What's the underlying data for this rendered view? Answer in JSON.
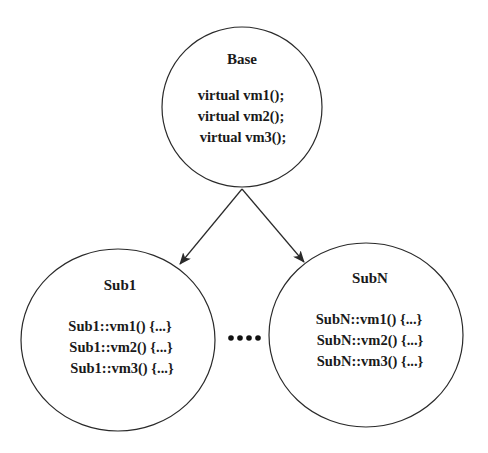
{
  "diagram": {
    "type": "class-inheritance",
    "nodes": {
      "base": {
        "title": "Base",
        "lines": [
          "virtual vm1();",
          "virtual vm2();",
          "virtual vm3();"
        ]
      },
      "sub1": {
        "title": "Sub1",
        "lines": [
          "Sub1::vm1() {...}",
          "Sub1::vm2() {...}",
          "Sub1::vm3() {...}"
        ]
      },
      "subN": {
        "title": "SubN",
        "lines": [
          "SubN::vm1() {...}",
          "SubN::vm2() {...}",
          "SubN::vm3() {...}"
        ]
      }
    },
    "edges": [
      {
        "from": "base",
        "to": "sub1"
      },
      {
        "from": "base",
        "to": "subN"
      }
    ],
    "ellipsis": "····",
    "colors": {
      "stroke": "#2a2a2a",
      "text": "#1a1a1a",
      "background": "#ffffff"
    }
  }
}
